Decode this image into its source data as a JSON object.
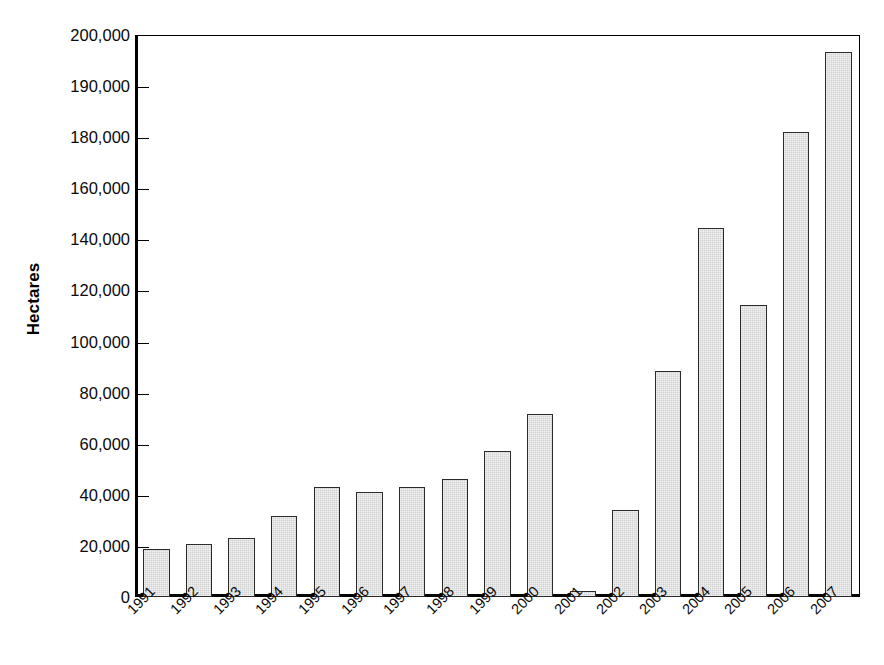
{
  "chart_data": {
    "type": "bar",
    "title": "",
    "subtitle": "",
    "xlabel": "",
    "ylabel": "Hectares",
    "categories": [
      "1991",
      "1992",
      "1993",
      "1994",
      "1995",
      "1996",
      "1997",
      "1998",
      "1999",
      "2000",
      "2001",
      "2002",
      "2003",
      "2004",
      "2005",
      "2006",
      "2007"
    ],
    "values": [
      17000,
      19000,
      21000,
      29000,
      39000,
      37500,
      39000,
      42000,
      52000,
      65000,
      2300,
      31000,
      80500,
      131500,
      104000,
      165500,
      194000
    ],
    "ylim": [
      0,
      200000
    ],
    "ytick_values": [
      0,
      20000,
      40000,
      60000,
      80000,
      100000,
      120000,
      140000,
      160000,
      180000,
      190000,
      200000
    ],
    "ytick_labels": [
      "0",
      "20,000",
      "40,000",
      "60,000",
      "80,000",
      "100,000",
      "120,000",
      "140,000",
      "160,000",
      "180,000",
      "190,000",
      "200,000"
    ],
    "grid": false,
    "legend": null,
    "legend_position": "none",
    "bar_fill_color": "#d2d2d2",
    "bar_edge_color": "#2b2b2b",
    "axis_color": "#000000",
    "background_color": "#ffffff",
    "xtick_rotation": -45
  },
  "axis": {
    "y_title": "Hectares"
  }
}
